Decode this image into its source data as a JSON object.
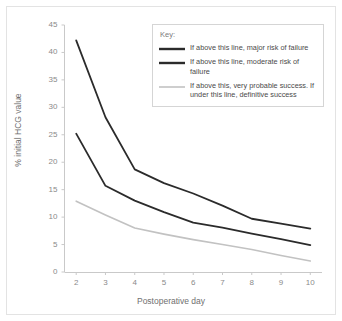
{
  "chart_data": {
    "type": "line",
    "title": "",
    "xlabel": "Postoperative day",
    "ylabel": "% initial HCG value",
    "x": [
      2,
      3,
      4,
      5,
      6,
      7,
      8,
      9,
      10
    ],
    "xlim": [
      1.6,
      10.4
    ],
    "ylim": [
      0,
      45
    ],
    "xticks": [
      "2",
      "3",
      "4",
      "5",
      "6",
      "7",
      "8",
      "9",
      "10"
    ],
    "yticks": [
      "0",
      "5",
      "10",
      "15",
      "20",
      "25",
      "30",
      "35",
      "40",
      "45"
    ],
    "grid": false,
    "legend_position": "top-right",
    "series": [
      {
        "name": "major-risk",
        "legend_label": "If above this line, major risk of failure",
        "color": "#2b2b2b",
        "width": 1.8,
        "values": [
          42.2,
          28.2,
          18.7,
          16.2,
          14.3,
          12.1,
          9.7,
          8.8,
          7.9
        ]
      },
      {
        "name": "moderate-risk",
        "legend_label": "If above this line, moderate risk of failure",
        "color": "#2b2b2b",
        "width": 1.8,
        "values": [
          25.2,
          15.7,
          13.0,
          10.9,
          9.0,
          8.1,
          7.0,
          6.0,
          4.9
        ]
      },
      {
        "name": "probable-success",
        "legend_label": "If above this, very probable success. If under this line, definitive success",
        "color": "#c2c2c2",
        "width": 1.6,
        "values": [
          12.9,
          10.4,
          8.0,
          6.9,
          5.9,
          5.0,
          4.1,
          3.0,
          2.0
        ]
      }
    ]
  },
  "legend": {
    "title": "Key:"
  },
  "style": {
    "axis_color": "#c9c9c9",
    "tick_text_color": "#8a8a8a",
    "frame_color": "#e3e3e3",
    "background": "#ffffff"
  }
}
